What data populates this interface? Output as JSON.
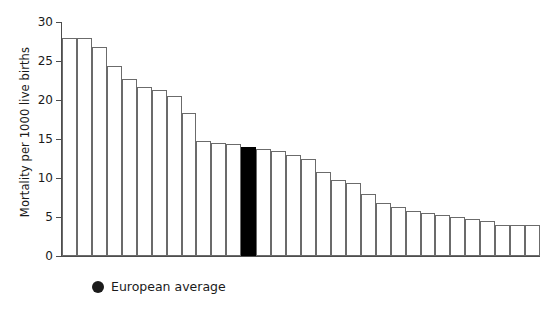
{
  "chart_data": {
    "type": "bar",
    "title": "",
    "subtitle": "",
    "xlabel": "",
    "ylabel": "Mortality per 1000 live births",
    "ylim": [
      0,
      30
    ],
    "yticks": [
      0,
      5,
      10,
      15,
      20,
      25,
      30
    ],
    "ytick_labels": [
      "0",
      "5",
      "10",
      "15",
      "20",
      "25",
      "30"
    ],
    "xticks_shown": false,
    "xtick_labels": [],
    "grid": false,
    "legend_position": "below-axes-left",
    "legend": [
      {
        "label": "European average",
        "marker": "filled-circle",
        "color": "#1b1b1b"
      }
    ],
    "bar_style": {
      "fill": "#ffffff",
      "edge": "#6b6b6b",
      "highlight_fill": "#000000",
      "highlight_edge": "#000000"
    },
    "highlight_index": 12,
    "highlight_note": "European average",
    "categories": [
      "1",
      "2",
      "3",
      "4",
      "5",
      "6",
      "7",
      "8",
      "9",
      "10",
      "11",
      "12",
      "13",
      "14",
      "15",
      "16",
      "17",
      "18",
      "19",
      "20",
      "21",
      "22",
      "23",
      "24",
      "25",
      "26",
      "27",
      "28",
      "29",
      "30",
      "31",
      "32"
    ],
    "values": [
      28.0,
      28.0,
      26.8,
      24.3,
      22.7,
      21.7,
      21.3,
      20.5,
      18.3,
      14.8,
      14.5,
      14.3,
      14.0,
      13.7,
      13.5,
      13.0,
      12.5,
      10.8,
      9.7,
      9.3,
      8.0,
      6.8,
      6.3,
      5.8,
      5.5,
      5.3,
      5.0,
      4.8,
      4.5,
      4.0,
      4.0,
      4.0
    ]
  },
  "legend": {
    "european_average_label": "European average"
  },
  "axes": {
    "y_title": "Mortality per 1000 live births"
  }
}
